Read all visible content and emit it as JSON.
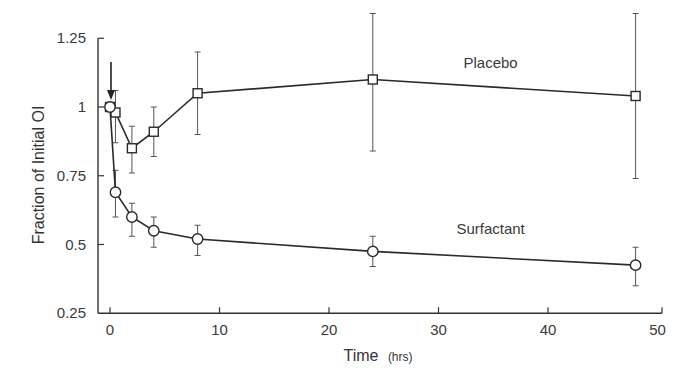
{
  "chart_data": {
    "type": "line",
    "title": "",
    "xlabel": "Time",
    "xlabel_unit": "(hrs)",
    "ylabel": "Fraction of Initial OI",
    "xlim": [
      -1,
      50
    ],
    "ylim": [
      0.25,
      1.25
    ],
    "x_ticks": [
      0,
      10,
      20,
      30,
      40,
      50
    ],
    "y_ticks": [
      0.25,
      0.5,
      0.75,
      1,
      1.25
    ],
    "y_tick_labels": [
      "0.25",
      "0.5",
      "0.75",
      "1",
      "1.25"
    ],
    "grid": false,
    "legend": "inline labels",
    "annotations": [
      {
        "type": "arrow",
        "x": 0,
        "direction": "down",
        "meaning": "dose administered at time 0"
      }
    ],
    "series": [
      {
        "name": "Placebo",
        "marker": "square",
        "x": [
          0,
          0.5,
          2,
          4,
          8,
          24,
          48
        ],
        "y": [
          1.0,
          0.98,
          0.85,
          0.91,
          1.05,
          1.1,
          1.04
        ],
        "err_low": [
          null,
          0.87,
          0.76,
          0.82,
          0.9,
          0.84,
          0.74
        ],
        "err_high": [
          null,
          1.06,
          0.93,
          1.0,
          1.2,
          1.34,
          1.34
        ],
        "label_pos": {
          "x": 28,
          "y": 1.16
        }
      },
      {
        "name": "Surfactant",
        "marker": "circle",
        "x": [
          0,
          0.5,
          2,
          4,
          8,
          24,
          48
        ],
        "y": [
          1.0,
          0.69,
          0.6,
          0.55,
          0.52,
          0.475,
          0.425
        ],
        "err_low": [
          null,
          0.6,
          0.53,
          0.49,
          0.46,
          0.42,
          0.35
        ],
        "err_high": [
          null,
          0.77,
          0.65,
          0.6,
          0.57,
          0.53,
          0.49
        ],
        "label_pos": {
          "x": 28,
          "y": 0.555
        }
      }
    ]
  }
}
